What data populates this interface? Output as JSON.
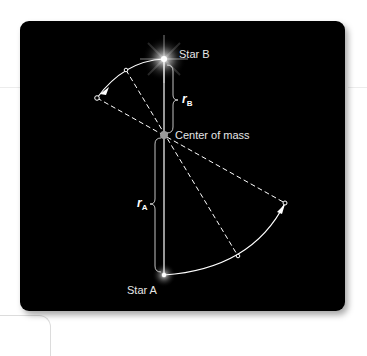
{
  "diagram": {
    "labels": {
      "star_b": "Star B",
      "star_a": "Star A",
      "center_of_mass": "Center of mass",
      "r_b_symbol": "r",
      "r_b_subscript": "B",
      "r_a_symbol": "r",
      "r_a_subscript": "A"
    },
    "colors": {
      "panel_background": "#000000",
      "line_color": "#ffffff",
      "label_color": "#e6e6e6",
      "center_marker": "#9a9a9a"
    },
    "points": {
      "star_b": [
        144,
        38
      ],
      "center_of_mass": [
        144,
        114
      ],
      "star_a": [
        144,
        254
      ],
      "arc_b_mid": [
        106,
        49
      ],
      "arc_b_end": [
        77,
        77
      ],
      "arc_a_mid": [
        218,
        235
      ],
      "arc_a_end": [
        265,
        182
      ]
    }
  }
}
